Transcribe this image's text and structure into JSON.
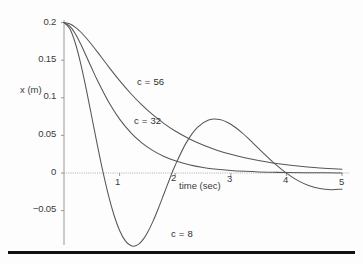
{
  "figure": {
    "background_color": "#fdfdfd",
    "line_color": "#555555",
    "axis_color": "#8a8a8a",
    "rule_color": "#111111"
  },
  "axes": {
    "x_title": "time (sec)",
    "y_title": "x (m)",
    "x_ticks": [
      "1",
      "2",
      "3",
      "4",
      "5"
    ],
    "y_ticks": [
      "0.2",
      "0.15",
      "0.1",
      "0.05",
      "0",
      "−0.05"
    ]
  },
  "series_labels": {
    "c56": "c = 56",
    "c32": "c = 32",
    "c8": "c = 8"
  },
  "chart_data": {
    "type": "line",
    "title": "",
    "xlabel": "time (sec)",
    "ylabel": "x (m)",
    "xlim": [
      0,
      5
    ],
    "ylim": [
      -0.09,
      0.21
    ],
    "xticks": [
      1,
      2,
      3,
      4,
      5
    ],
    "yticks": [
      -0.05,
      0,
      0.05,
      0.1,
      0.15,
      0.2
    ],
    "grid": false,
    "legend": "inline-annotations",
    "annotations": [
      {
        "text": "c = 56",
        "x": 1.6,
        "y": 0.118
      },
      {
        "text": "c = 32",
        "x": 1.55,
        "y": 0.065
      },
      {
        "text": "c = 8",
        "x": 2.05,
        "y": -0.077
      }
    ],
    "series": [
      {
        "name": "c = 56",
        "label": "c = 56",
        "x": [
          0,
          0.1,
          0.2,
          0.3,
          0.4,
          0.5,
          0.6,
          0.8,
          1.0,
          1.2,
          1.4,
          1.6,
          1.8,
          2.0,
          2.25,
          2.5,
          2.75,
          3.0,
          3.25,
          3.5,
          3.75,
          4.0,
          4.25,
          4.5,
          4.75,
          5.0
        ],
        "y": [
          0.2,
          0.1985,
          0.194,
          0.1875,
          0.1795,
          0.1705,
          0.161,
          0.1415,
          0.1228,
          0.1057,
          0.0905,
          0.0772,
          0.0657,
          0.0558,
          0.0456,
          0.0372,
          0.0304,
          0.0248,
          0.0202,
          0.0165,
          0.0134,
          0.011,
          0.009,
          0.0073,
          0.006,
          0.0049
        ]
      },
      {
        "name": "c = 32",
        "label": "c = 32",
        "x": [
          0,
          0.1,
          0.2,
          0.3,
          0.4,
          0.5,
          0.6,
          0.8,
          1.0,
          1.2,
          1.4,
          1.6,
          1.8,
          2.0,
          2.25,
          2.5,
          2.75,
          3.0,
          3.25,
          3.5,
          3.75,
          4.0,
          4.5,
          5.0
        ],
        "y": [
          0.2,
          0.1955,
          0.1855,
          0.1715,
          0.1555,
          0.1392,
          0.1232,
          0.0947,
          0.0717,
          0.0538,
          0.0401,
          0.0297,
          0.022,
          0.0162,
          0.0109,
          0.0073,
          0.0049,
          0.0033,
          0.0022,
          0.0014,
          0.001,
          0.0006,
          0.0003,
          0.0001
        ]
      },
      {
        "name": "c = 8",
        "label": "c = 8",
        "x": [
          0,
          0.1,
          0.2,
          0.3,
          0.4,
          0.5,
          0.6,
          0.7,
          0.8,
          0.9,
          1.0,
          1.1,
          1.2,
          1.3,
          1.4,
          1.5,
          1.6,
          1.7,
          1.8,
          1.9,
          2.0,
          2.2,
          2.4,
          2.6,
          2.8,
          3.0,
          3.2,
          3.4,
          3.6,
          3.8,
          4.0,
          4.2,
          4.4,
          4.6,
          4.8,
          5.0
        ],
        "y": [
          0.2,
          0.1925,
          0.1735,
          0.1455,
          0.1115,
          0.0745,
          0.0372,
          0.0018,
          -0.0298,
          -0.0562,
          -0.0764,
          -0.0899,
          -0.0965,
          -0.0965,
          -0.0905,
          -0.0794,
          -0.0643,
          -0.0465,
          -0.0273,
          -0.008,
          0.0103,
          0.0404,
          0.0607,
          0.0705,
          0.0712,
          0.0648,
          0.0536,
          0.0398,
          0.0254,
          0.0117,
          -0.0002,
          -0.0098,
          -0.0166,
          -0.0207,
          -0.0222,
          -0.0215
        ]
      }
    ]
  }
}
